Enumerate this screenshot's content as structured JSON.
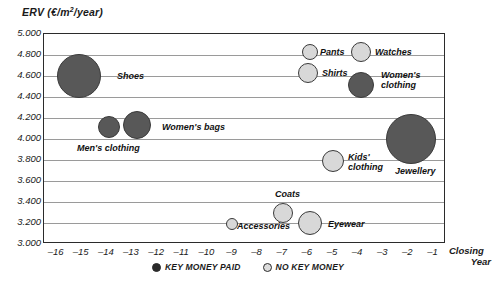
{
  "chart_data": {
    "type": "scatter",
    "title": "",
    "ylabel": "ERV (€/m²/year)",
    "xlabel": "Closing Year",
    "xlim": [
      -16.5,
      -0.5
    ],
    "ylim": [
      3000,
      5000
    ],
    "grid": true,
    "legend_position": "bottom-center",
    "y_ticks": [
      "5.000",
      "4.800",
      "4.600",
      "4.400",
      "4.200",
      "4.000",
      "3.800",
      "3.600",
      "3.400",
      "3.200",
      "3.000"
    ],
    "y_tick_values": [
      5000,
      4800,
      4600,
      4400,
      4200,
      4000,
      3800,
      3600,
      3400,
      3200,
      3000
    ],
    "x_ticks": [
      "–16",
      "–15",
      "–14",
      "–13",
      "–12",
      "–11",
      "–10",
      "–9",
      "–8",
      "–7",
      "–6",
      "–5",
      "–4",
      "–3",
      "–2",
      "–1"
    ],
    "x_tick_values": [
      -16,
      -15,
      -14,
      -13,
      -12,
      -11,
      -10,
      -9,
      -8,
      -7,
      -6,
      -5,
      -4,
      -3,
      -2,
      -1
    ],
    "series": [
      {
        "name": "KEY MONEY PAID",
        "color": "#585858",
        "points": [
          {
            "label": "Shoes",
            "x": -15.1,
            "y": 4600,
            "r": 22,
            "label_dx": 26,
            "label_dy": 0,
            "lines": [
              "Shoes"
            ]
          },
          {
            "label": "Men's clothing",
            "x": -13.9,
            "y": 4110,
            "r": 11,
            "label_dx": -32,
            "label_dy": 21,
            "lines": [
              "Men's clothing"
            ]
          },
          {
            "label": "Women's bags",
            "x": -12.8,
            "y": 4130,
            "r": 14,
            "label_dx": 21,
            "label_dy": 2,
            "lines": [
              "Women's bags"
            ]
          },
          {
            "label": "Women's clothing",
            "x": -3.9,
            "y": 4510,
            "r": 13,
            "label_dx": 17,
            "label_dy": -5,
            "lines": [
              "Women's",
              "clothing"
            ]
          },
          {
            "label": "Jewellery",
            "x": -1.9,
            "y": 4000,
            "r": 25,
            "label_dx": -16,
            "label_dy": 32,
            "lines": [
              "Jewellery"
            ]
          }
        ]
      },
      {
        "name": "NO KEY MONEY",
        "color": "#d8d8d8",
        "points": [
          {
            "label": "Pants",
            "x": -5.9,
            "y": 4830,
            "r": 8,
            "label_dx": 12,
            "label_dy": 0,
            "lines": [
              "Pants"
            ]
          },
          {
            "label": "Watches",
            "x": -3.9,
            "y": 4830,
            "r": 10,
            "label_dx": 14,
            "label_dy": 0,
            "lines": [
              "Watches"
            ]
          },
          {
            "label": "Shirts",
            "x": -6.0,
            "y": 4630,
            "r": 10,
            "label_dx": 14,
            "label_dy": 0,
            "lines": [
              "Shirts"
            ]
          },
          {
            "label": "Kids' clothing",
            "x": -5.0,
            "y": 3790,
            "r": 11,
            "label_dx": 14,
            "label_dy": 1,
            "lines": [
              "Kids'",
              "clothing"
            ]
          },
          {
            "label": "Coats",
            "x": -7.0,
            "y": 3300,
            "r": 10,
            "label_dx": -8,
            "label_dy": -19,
            "lines": [
              "Coats"
            ]
          },
          {
            "label": "Accessories",
            "x": -9.0,
            "y": 3190,
            "r": 6,
            "label_dx": 9,
            "label_dy": 2,
            "lines": [
              "Accessories"
            ]
          },
          {
            "label": "Eyewear",
            "x": -5.9,
            "y": 3200,
            "r": 12,
            "label_dx": 16,
            "label_dy": 1,
            "lines": [
              "Eyewear"
            ]
          }
        ]
      }
    ],
    "legend": [
      {
        "label": "KEY MONEY PAID",
        "swatch": "paid"
      },
      {
        "label": "NO KEY MONEY",
        "swatch": "nokey"
      }
    ]
  }
}
